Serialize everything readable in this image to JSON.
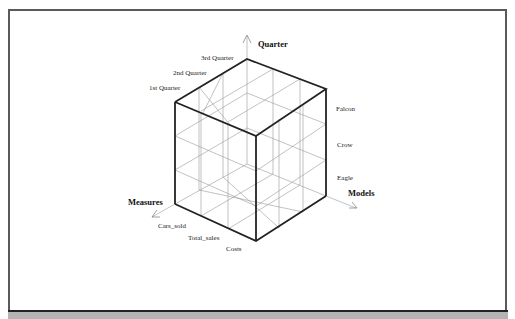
{
  "diagram": {
    "type": "olap-data-cube",
    "axes": {
      "vertical": {
        "title": "Quarter",
        "members": [
          "1st Quarter",
          "2nd Quarter",
          "3rd Quarter"
        ]
      },
      "right": {
        "title": "Models",
        "members": [
          "Falcon",
          "Crow",
          "Eagle"
        ]
      },
      "left": {
        "title": "Measures",
        "members": [
          "Cars_sold",
          "Total_sales",
          "Costs"
        ]
      }
    }
  }
}
